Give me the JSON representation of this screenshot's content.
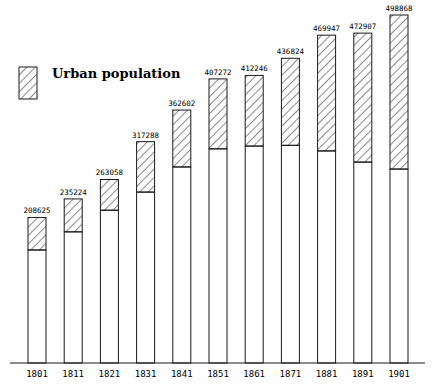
{
  "chart_data": {
    "type": "bar",
    "stacked": true,
    "title": "",
    "xlabel": "",
    "ylabel": "",
    "grid": false,
    "legend_position": "top-left",
    "categories": [
      "1801",
      "1811",
      "1821",
      "1831",
      "1841",
      "1851",
      "1861",
      "1871",
      "1881",
      "1891",
      "1901"
    ],
    "totals": [
      208625,
      235224,
      263058,
      317288,
      362602,
      407272,
      412246,
      436824,
      469947,
      472907,
      498868
    ],
    "series": [
      {
        "name": "Rural population",
        "hatched": false,
        "values": [
          162000,
          188000,
          219000,
          245000,
          281000,
          307000,
          311000,
          312000,
          304000,
          288000,
          278000
        ]
      },
      {
        "name": "Urban population",
        "hatched": true,
        "values": [
          46625,
          47224,
          44058,
          72288,
          81602,
          100272,
          101246,
          124824,
          165947,
          184907,
          220868
        ]
      }
    ],
    "ylim": [
      0,
      500000
    ],
    "legend": [
      {
        "label": "Urban population",
        "pattern": "diagonal-hatch"
      }
    ]
  },
  "colors": {
    "ink": "#1a1a1a",
    "background": "#ffffff"
  }
}
